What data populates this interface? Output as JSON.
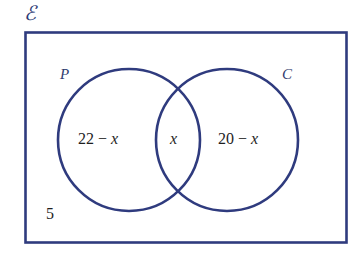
{
  "diagram": {
    "type": "venn-two-set",
    "universal_set_label": "ℰ",
    "colors": {
      "stroke": "#2f3b7e",
      "rectangle_stroke": "#2f3b7e",
      "text": "#1e1e1e",
      "label_text": "#2f3b6e",
      "background": "#ffffff"
    },
    "rectangle": {
      "x": 25,
      "y": 32,
      "width": 322,
      "height": 211
    },
    "circles": [
      {
        "name": "P",
        "label": "P",
        "cx": 129,
        "cy": 140,
        "r": 71
      },
      {
        "name": "C",
        "label": "C",
        "cx": 227,
        "cy": 140,
        "r": 71
      }
    ],
    "regions": [
      {
        "name": "p-only",
        "value": "22 − x",
        "number": "22 − ",
        "variable": "x"
      },
      {
        "name": "intersection",
        "value": "x",
        "number": "",
        "variable": "x"
      },
      {
        "name": "c-only",
        "value": "20 − x",
        "number": "20 − ",
        "variable": "x"
      },
      {
        "name": "outside",
        "value": "5",
        "number": "5",
        "variable": ""
      }
    ]
  },
  "labels": {
    "universal": "ℰ",
    "set_p": "P",
    "set_c": "C",
    "p_only_number": "22 − ",
    "p_only_var": "x",
    "intersection_var": "x",
    "c_only_number": "20 − ",
    "c_only_var": "x",
    "outside_value": "5"
  }
}
